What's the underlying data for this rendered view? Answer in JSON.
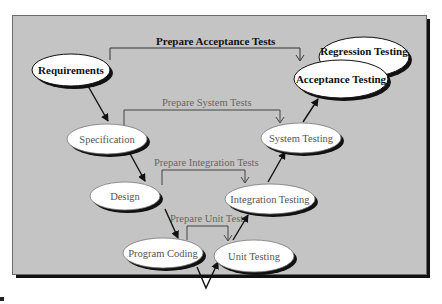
{
  "diagram": {
    "colors": {
      "background": "#c4c4c4",
      "node_fill": "#ffffff",
      "node_shadow": "#111111",
      "bold_text": "#111111",
      "light_text": "#555555",
      "connector": "#333333"
    },
    "nodes": {
      "requirements": {
        "label": "Requirements",
        "style": "bold"
      },
      "specification": {
        "label": "Specification",
        "style": "light"
      },
      "design": {
        "label": "Design",
        "style": "light"
      },
      "program_coding": {
        "label": "Program Coding",
        "style": "light"
      },
      "unit_testing": {
        "label": "Unit Testing",
        "style": "light"
      },
      "integration_testing": {
        "label": "Integration Testing",
        "style": "light"
      },
      "system_testing": {
        "label": "System Testing",
        "style": "light"
      },
      "acceptance_testing": {
        "label": "Acceptance Testing",
        "style": "bold"
      },
      "regression_testing": {
        "label": "Regression Testing",
        "style": "bold"
      }
    },
    "connectors": {
      "acceptance": {
        "label": "Prepare Acceptance Tests",
        "from": "Requirements",
        "to": "Acceptance Testing"
      },
      "system": {
        "label": "Prepare System Tests",
        "from": "Specification",
        "to": "System Testing"
      },
      "integration": {
        "label": "Prepare Integration Tests",
        "from": "Design",
        "to": "Integration Testing"
      },
      "unit": {
        "label": "Prepare Unit Tests",
        "from": "Program Coding",
        "to": "Unit Testing"
      }
    },
    "flow": [
      "Requirements",
      "Specification",
      "Design",
      "Program Coding",
      "Unit Testing",
      "Integration Testing",
      "System Testing",
      "Acceptance Testing"
    ]
  }
}
